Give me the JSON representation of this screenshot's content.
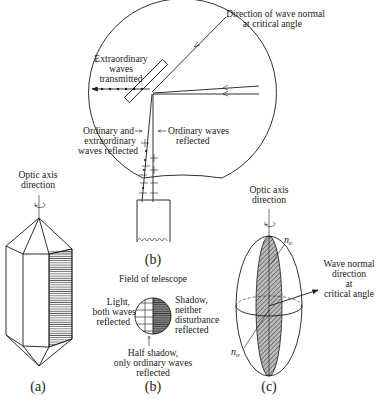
{
  "figure": {
    "panel_b_top": {
      "labels": {
        "wave_normal_line1": "Direction of wave normal",
        "wave_normal_line2": "at critical angle",
        "extraordinary_line1": "Extraordinary",
        "extraordinary_line2": "waves",
        "extraordinary_line3": "transmitted",
        "ord_extra_line1": "Ordinary and",
        "ord_extra_line2": "extraordinary",
        "ord_extra_line3": "waves reflected",
        "ordinary_line1": "Ordinary waves",
        "ordinary_line2": "reflected"
      },
      "caption": "(b)"
    },
    "panel_a": {
      "axis_line1": "Optic axis",
      "axis_line2": "direction",
      "caption": "(a)"
    },
    "panel_b_field": {
      "title": "Field of telescope",
      "light_line1": "Light,",
      "light_line2": "both waves",
      "light_line3": "reflected",
      "shadow_line1": "Shadow,",
      "shadow_line2": "neither",
      "shadow_line3": "disturbance",
      "shadow_line4": "reflected",
      "half_line1": "Half shadow,",
      "half_line2": "only ordinary waves",
      "half_line3": "reflected",
      "caption": "(b)"
    },
    "panel_c": {
      "axis_line1": "Optic axis",
      "axis_line2": "direction",
      "ne": "n",
      "ne_sub": "e",
      "no": "n",
      "no_sub": "o",
      "wave_line1": "Wave normal",
      "wave_line2": "direction",
      "wave_line3": "at",
      "wave_line4": "critical angle",
      "caption": "(c)"
    }
  },
  "colors": {
    "ink": "#1a1a1a",
    "background": "#ffffff"
  }
}
